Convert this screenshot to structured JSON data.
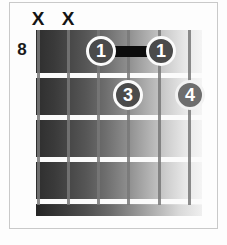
{
  "diagram": {
    "type": "guitar-chord-diagram",
    "starting_fret_label": "8",
    "strings_count": 6,
    "frets_shown": 4,
    "muted_strings": [
      {
        "label": "X",
        "string": 1,
        "x": 29
      },
      {
        "label": "X",
        "string": 2,
        "x": 59
      }
    ],
    "fingerings": [
      {
        "label": "1",
        "string": 3,
        "fret": 1,
        "cx": 101,
        "cy": 51,
        "shade": "dark"
      },
      {
        "label": "1",
        "string": 5,
        "fret": 1,
        "cx": 161,
        "cy": 51,
        "shade": "dark"
      },
      {
        "label": "3",
        "string": 4,
        "fret": 2,
        "cx": 128,
        "cy": 95,
        "shade": "dark"
      },
      {
        "label": "4",
        "string": 6,
        "fret": 2,
        "cx": 190,
        "cy": 95,
        "shade": "light"
      }
    ],
    "barre": {
      "fret": 1,
      "from_string": 3,
      "to_string": 5,
      "left": 113,
      "top": 46,
      "width": 37
    },
    "fret_lines_y": [
      43,
      85,
      127,
      169
    ],
    "string_x": [
      38,
      68,
      98,
      128,
      159,
      190
    ],
    "colors": {
      "dot_fill": "#4b4b4b",
      "dot_fill_light": "#6d6d6d",
      "dot_text": "#ffffff",
      "barre": "#0c0c0c",
      "label_text": "#1a1a1a",
      "frame_border": "#c9c9c9",
      "background": "#fdfdfd"
    }
  }
}
